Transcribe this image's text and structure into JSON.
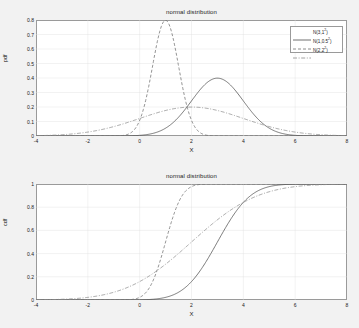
{
  "figure": {
    "background": "#f2f2f2",
    "plot_background": "#ffffff",
    "axis_color": "#9a9a9a"
  },
  "panels": [
    {
      "id": "pdf",
      "title": "normal distribution",
      "xlabel": "X",
      "ylabel": "pdf",
      "xticks": [
        "-4",
        "-2",
        "0",
        "2",
        "4",
        "6",
        "8"
      ],
      "yticks": [
        "0",
        "0.1",
        "0.2",
        "0.3",
        "0.4",
        "0.5",
        "0.6",
        "0.7",
        "0.8"
      ]
    },
    {
      "id": "cdf",
      "title": "normal distribution",
      "xlabel": "X",
      "ylabel": "cdf",
      "xticks": [
        "-4",
        "-2",
        "0",
        "2",
        "4",
        "6",
        "8"
      ],
      "yticks": [
        "0",
        "0.2",
        "0.4",
        "0.6",
        "0.8",
        "1"
      ]
    }
  ],
  "legend": {
    "entries": [
      {
        "label": "N(3,1",
        "exponent": "2",
        "suffix": ")",
        "style": "solid",
        "color": "#4d4d4d"
      },
      {
        "label": "N(1,0.5",
        "exponent": "2",
        "suffix": ")",
        "style": "dashed",
        "color": "#707070"
      },
      {
        "label": "N(2,2",
        "exponent": "2",
        "suffix": ")",
        "style": "dashdot",
        "color": "#8a8a8a"
      }
    ]
  },
  "chart_data": [
    {
      "type": "line",
      "id": "pdf",
      "title": "normal distribution",
      "xlabel": "X",
      "ylabel": "pdf",
      "xlim": [
        -4,
        8
      ],
      "ylim": [
        0,
        0.8
      ],
      "xticks": [
        -4,
        -2,
        0,
        2,
        4,
        6,
        8
      ],
      "yticks": [
        0,
        0.1,
        0.2,
        0.3,
        0.4,
        0.5,
        0.6,
        0.7,
        0.8
      ],
      "grid": true,
      "legend_position": "top-right",
      "series": [
        {
          "name": "N(3,1^2)",
          "mean": 3,
          "sigma": 1,
          "style": "solid",
          "color": "#4d4d4d",
          "peak_value": 0.399,
          "peak_x": 3,
          "x": [
            -4,
            -3,
            -2,
            -1,
            0,
            0.5,
            1,
            1.5,
            2,
            2.5,
            3,
            3.5,
            4,
            4.5,
            5,
            5.5,
            6,
            7,
            8
          ],
          "y": [
            0.0,
            0.0,
            0.0,
            0.0001,
            0.0044,
            0.0175,
            0.054,
            0.1295,
            0.242,
            0.3521,
            0.3989,
            0.3521,
            0.242,
            0.1295,
            0.054,
            0.0175,
            0.0044,
            0.0001,
            0.0
          ]
        },
        {
          "name": "N(1,0.5^2)",
          "mean": 1,
          "sigma": 0.5,
          "style": "dashed",
          "color": "#707070",
          "peak_value": 0.798,
          "peak_x": 1,
          "x": [
            -4,
            -2,
            -1,
            -0.5,
            0,
            0.25,
            0.5,
            0.75,
            1,
            1.25,
            1.5,
            1.75,
            2,
            2.5,
            3,
            4,
            6,
            8
          ],
          "y": [
            0.0,
            0.0,
            0.0003,
            0.0027,
            0.108,
            0.259,
            0.4839,
            0.7041,
            0.7979,
            0.7041,
            0.4839,
            0.259,
            0.108,
            0.0107,
            0.0003,
            0.0,
            0.0,
            0.0
          ]
        },
        {
          "name": "N(2,2^2)",
          "mean": 2,
          "sigma": 2,
          "style": "dashdot",
          "color": "#8a8a8a",
          "peak_value": 0.199,
          "peak_x": 2,
          "x": [
            -4,
            -3,
            -2,
            -1,
            0,
            1,
            2,
            3,
            4,
            5,
            6,
            7,
            8
          ],
          "y": [
            0.0022,
            0.0088,
            0.027,
            0.0648,
            0.121,
            0.176,
            0.1995,
            0.176,
            0.121,
            0.0648,
            0.027,
            0.0088,
            0.0022
          ]
        }
      ]
    },
    {
      "type": "line",
      "id": "cdf",
      "title": "normal distribution",
      "xlabel": "X",
      "ylabel": "cdf",
      "xlim": [
        -4,
        8
      ],
      "ylim": [
        0,
        1
      ],
      "xticks": [
        -4,
        -2,
        0,
        2,
        4,
        6,
        8
      ],
      "yticks": [
        0,
        0.2,
        0.4,
        0.6,
        0.8,
        1
      ],
      "grid": true,
      "legend_position": "top-right",
      "series": [
        {
          "name": "N(3,1^2)",
          "mean": 3,
          "sigma": 1,
          "style": "solid",
          "color": "#4d4d4d",
          "x": [
            -4,
            -2,
            0,
            1,
            1.5,
            2,
            2.5,
            3,
            3.5,
            4,
            4.5,
            5,
            5.5,
            6,
            7,
            8
          ],
          "y": [
            0.0,
            0.0,
            0.0013,
            0.0228,
            0.0668,
            0.1587,
            0.3085,
            0.5,
            0.6915,
            0.8413,
            0.9332,
            0.9772,
            0.9938,
            0.9987,
            1.0,
            1.0
          ]
        },
        {
          "name": "N(1,0.5^2)",
          "mean": 1,
          "sigma": 0.5,
          "style": "dashed",
          "color": "#707070",
          "x": [
            -4,
            -2,
            -0.5,
            0,
            0.25,
            0.5,
            0.75,
            1,
            1.25,
            1.5,
            1.75,
            2,
            2.5,
            3,
            4,
            6,
            8
          ],
          "y": [
            0.0,
            0.0,
            0.0013,
            0.0228,
            0.0668,
            0.1587,
            0.3085,
            0.5,
            0.6915,
            0.8413,
            0.9332,
            0.9772,
            0.9987,
            1.0,
            1.0,
            1.0,
            1.0
          ]
        },
        {
          "name": "N(2,2^2)",
          "mean": 2,
          "sigma": 2,
          "style": "dashdot",
          "color": "#8a8a8a",
          "x": [
            -4,
            -3,
            -2,
            -1,
            0,
            1,
            2,
            3,
            4,
            5,
            6,
            7,
            8
          ],
          "y": [
            0.0013,
            0.0062,
            0.0228,
            0.0668,
            0.1587,
            0.3085,
            0.5,
            0.6915,
            0.8413,
            0.9332,
            0.9772,
            0.9938,
            0.9987
          ]
        }
      ]
    }
  ]
}
